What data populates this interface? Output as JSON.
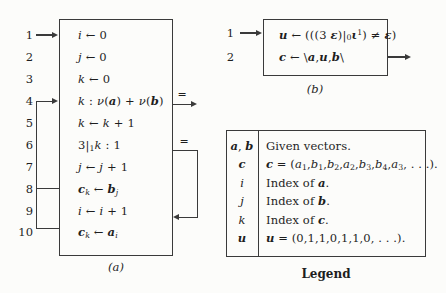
{
  "flowchart_a": {
    "caption": "(a)",
    "steps": [
      {
        "num": "1",
        "html": "<i>i</i> ← 0"
      },
      {
        "num": "2",
        "html": "<i>j</i> ← 0"
      },
      {
        "num": "3",
        "html": "<i>k</i> ← 0"
      },
      {
        "num": "4",
        "html": "<i>k</i> : <i>ν</i>(<b><i>a</i></b>) + <i>ν</i>(<b><i>b</i></b>)"
      },
      {
        "num": "5",
        "html": "<i>k</i> ← <i>k</i> + 1"
      },
      {
        "num": "6",
        "html": "3|<sub>1</sub><i>k</i> : 1"
      },
      {
        "num": "7",
        "html": "<i>j</i> ← <i>j</i> + 1"
      },
      {
        "num": "8",
        "html": "<b><i>c</i></b><sub><i>k</i></sub> ← <b><i>b</i></b><sub><i>j</i></sub>"
      },
      {
        "num": "9",
        "html": "<i>i</i> ← <i>i</i> + 1"
      },
      {
        "num": "10",
        "html": "<b><i>c</i></b><sub><i>k</i></sub> ← <b><i>a</i></b><sub><i>i</i></sub>"
      }
    ],
    "branches": {
      "equal_exit_label": "=",
      "equal_loop_label": "="
    }
  },
  "flowchart_b": {
    "caption": "(b)",
    "steps": [
      {
        "num": "1",
        "html": "<b><i>u</i></b> ← (((3 <b><i>ε</i></b>)|<sub>0</sub><b><i>ι</i></b><sup>1</sup>) ≠ <b><i>ε</i></b>)"
      },
      {
        "num": "2",
        "html": "<b><i>c</i></b> ← \\<b><i>a</i></b>,<b><i>u</i></b>,<b><i>b</i></b>\\"
      }
    ]
  },
  "legend": {
    "caption": "Legend",
    "rows": [
      {
        "symbol": "<b><i>a</i></b>, <b><i>b</i></b>",
        "description": "Given vectors."
      },
      {
        "symbol": "<b><i>c</i></b>",
        "description": "<b><i>c</i></b> = (<i>a</i><sub>1</sub>,<i>b</i><sub>1</sub>,<i>b</i><sub>2</sub>,<i>a</i><sub>2</sub>,<i>b</i><sub>3</sub>,<i>b</i><sub>4</sub>,<i>a</i><sub>3</sub>, . . .)."
      },
      {
        "symbol": "<i>i</i>",
        "description": "Index of <b><i>a</i></b>."
      },
      {
        "symbol": "<i>j</i>",
        "description": "Index of <b><i>b</i></b>."
      },
      {
        "symbol": "<i>k</i>",
        "description": "Index of <b><i>c</i></b>."
      },
      {
        "symbol": "<b><i>u</i></b>",
        "description": "<b><i>u</i></b> = (0,1,1,0,1,1,0, . . .)."
      }
    ]
  }
}
